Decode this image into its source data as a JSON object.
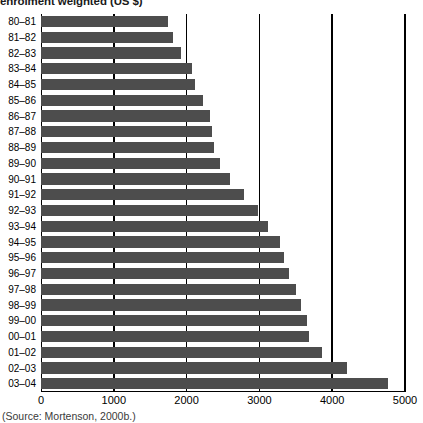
{
  "chart_data": {
    "type": "bar",
    "orientation": "horizontal",
    "title": "enrolment weighted (US $)",
    "xlabel": "",
    "ylabel": "",
    "xlim": [
      0,
      5000
    ],
    "grid": true,
    "legend": null,
    "xticks": [
      "0",
      "1000",
      "2000",
      "3000",
      "4000",
      "5000"
    ],
    "xtick_values": [
      0,
      1000,
      2000,
      3000,
      4000,
      5000
    ],
    "categories": [
      "80–81",
      "81–82",
      "82–83",
      "83–84",
      "84–85",
      "85–86",
      "86–87",
      "87–88",
      "88–89",
      "89–90",
      "90–91",
      "91–92",
      "92–93",
      "93–94",
      "94–95",
      "95–96",
      "96–97",
      "97–98",
      "98–99",
      "99–00",
      "00–01",
      "01–02",
      "02–03",
      "03–04"
    ],
    "values": [
      1740,
      1810,
      1920,
      2080,
      2120,
      2220,
      2320,
      2350,
      2380,
      2460,
      2600,
      2790,
      2980,
      3120,
      3280,
      3340,
      3400,
      3500,
      3570,
      3650,
      3680,
      3860,
      4200,
      4765
    ],
    "series": [
      {
        "name": "enrolment weighted (US $)",
        "values": [
          1740,
          1810,
          1920,
          2080,
          2120,
          2220,
          2320,
          2350,
          2380,
          2460,
          2600,
          2790,
          2980,
          3120,
          3280,
          3340,
          3400,
          3500,
          3570,
          3650,
          3680,
          3860,
          4200,
          4765
        ]
      }
    ],
    "bar_color": "#4d4d4d",
    "axis_color": "#000000",
    "background": "#ffffff"
  },
  "caption": {
    "source": "(Source: Mortenson, 2000b.)"
  }
}
